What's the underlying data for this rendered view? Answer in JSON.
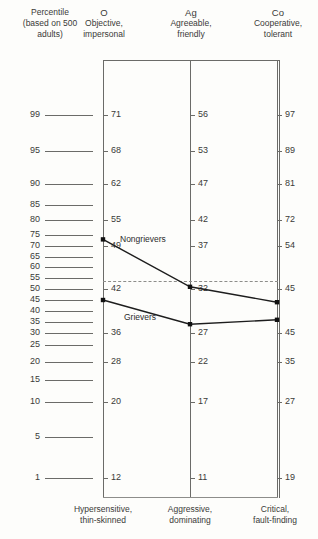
{
  "header": {
    "percentile_title": "Percentile",
    "percentile_sub": "(based on 500",
    "percentile_sub2": "adults)",
    "columns": [
      {
        "code": "O",
        "line1": "Objective,",
        "line2": "impersonal"
      },
      {
        "code": "Ag",
        "line1": "Agreeable,",
        "line2": "friendly"
      },
      {
        "code": "Co",
        "line1": "Cooperative,",
        "line2": "tolerant"
      }
    ]
  },
  "percentile_scale": {
    "ticks": [
      99,
      95,
      90,
      85,
      80,
      75,
      70,
      65,
      60,
      55,
      50,
      45,
      40,
      35,
      30,
      25,
      20,
      15,
      10,
      5,
      1
    ]
  },
  "bottom_labels": [
    {
      "line1": "Hypersensitive,",
      "line2": "thin-skinned"
    },
    {
      "line1": "Aggressive,",
      "line2": "dominating"
    },
    {
      "line1": "Critical,",
      "line2": "fault-finding"
    }
  ],
  "chart_data": {
    "type": "line",
    "xlabel": "",
    "ylabel": "Percentile (based on 500 adults)",
    "categories": [
      "O",
      "Ag",
      "Co"
    ],
    "ylim": [
      1,
      99
    ],
    "grid": false,
    "legend": "inline-labels",
    "reference_line": {
      "value": 50,
      "style": "dashed",
      "label": ""
    },
    "axis_raw_scales": [
      {
        "column": "O",
        "tick_percentiles": [
          99,
          95,
          90,
          80,
          70,
          50,
          30,
          20,
          10,
          1
        ],
        "tick_values": [
          71,
          68,
          62,
          55,
          49,
          42,
          36,
          28,
          20,
          12
        ]
      },
      {
        "column": "Ag",
        "tick_percentiles": [
          99,
          95,
          90,
          80,
          70,
          50,
          30,
          20,
          10,
          1
        ],
        "tick_values": [
          56,
          53,
          47,
          42,
          37,
          32,
          27,
          22,
          17,
          11
        ]
      },
      {
        "column": "Co",
        "tick_percentiles": [
          99,
          95,
          90,
          80,
          70,
          50,
          30,
          20,
          10,
          1
        ],
        "tick_values": [
          97,
          89,
          81,
          72,
          54,
          45,
          45,
          35,
          27,
          19
        ]
      }
    ],
    "series": [
      {
        "name": "Nongrievers",
        "percentiles": [
          73,
          51,
          44
        ],
        "raw_values": [
          55,
          37,
          45
        ]
      },
      {
        "name": "Grievers",
        "percentiles": [
          45,
          34,
          36
        ],
        "raw_values": [
          42,
          32,
          45
        ]
      }
    ]
  },
  "colors": {
    "line": "#1d1d1d",
    "axis": "#6b6b68",
    "text": "#3a3a38",
    "background": "#fdfdfb"
  }
}
